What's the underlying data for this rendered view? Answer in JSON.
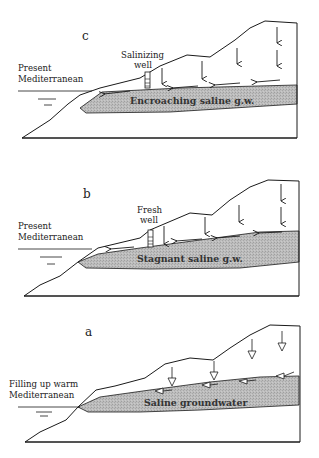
{
  "colors": {
    "line": "#1a1a1a",
    "saline_fill": "#b9b9b9",
    "background": "#ffffff"
  },
  "panels": [
    {
      "id": "c",
      "letter": "c",
      "sea_label": [
        "Present",
        "Mediterranean"
      ],
      "well_label": [
        "Salinizing",
        "well"
      ],
      "groundwater_label": "Encroaching saline g.w.",
      "arrow_style": "solid"
    },
    {
      "id": "b",
      "letter": "b",
      "sea_label": [
        "Present",
        "Mediterranean"
      ],
      "well_label": [
        "Fresh",
        "well"
      ],
      "groundwater_label": "Stagnant saline g.w.",
      "arrow_style": "solid"
    },
    {
      "id": "a",
      "letter": "a",
      "sea_label": [
        "Filling up warm",
        "Mediterranean"
      ],
      "well_label": null,
      "groundwater_label": "Saline groundwater",
      "arrow_style": "hollow"
    }
  ]
}
